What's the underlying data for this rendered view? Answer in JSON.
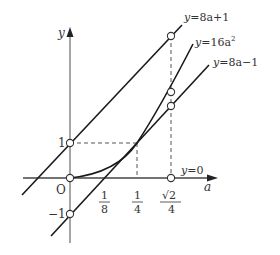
{
  "diagram": {
    "type": "function-graph",
    "axes": {
      "x_label": "a",
      "y_label": "y",
      "origin_label": "O"
    },
    "curves": [
      {
        "id": "line-upper",
        "equation": "y=8a+1",
        "label_lhs": "y",
        "label_rhs": "=8a+1"
      },
      {
        "id": "parabola",
        "equation": "y=16a²",
        "label_lhs": "y",
        "label_rhs": "=16a",
        "label_sup": "2"
      },
      {
        "id": "line-lower",
        "equation": "y=8a−1",
        "label_lhs": "y",
        "label_rhs": "=8a−1"
      },
      {
        "id": "x-axis-line",
        "equation": "y=0",
        "label_lhs": "y",
        "label_rhs": "=0"
      }
    ],
    "x_ticks": [
      {
        "num": "1",
        "den": "8",
        "value": 0.125
      },
      {
        "num": "1",
        "den": "4",
        "value": 0.25
      },
      {
        "num": "√2",
        "den": "4",
        "value": 0.3536
      }
    ],
    "y_ticks": [
      {
        "label": "1",
        "value": 1
      },
      {
        "label": "−1",
        "value": -1
      }
    ],
    "marked_points": [
      {
        "a": 0,
        "y": 1
      },
      {
        "a": 0,
        "y": 0
      },
      {
        "a": 0,
        "y": -1
      },
      {
        "a": "√2/4",
        "y": 0
      },
      {
        "a": "√2/4",
        "y": "8a+1"
      },
      {
        "a": "√2/4",
        "y": "16a²"
      },
      {
        "a": "√2/4",
        "y": "8a−1"
      }
    ],
    "tangent_point": {
      "a": "1/4",
      "y": 1
    },
    "colors": {
      "curve": "#1a1a1a",
      "axis": "#444444",
      "dashed": "#555555",
      "text": "#333333"
    }
  }
}
